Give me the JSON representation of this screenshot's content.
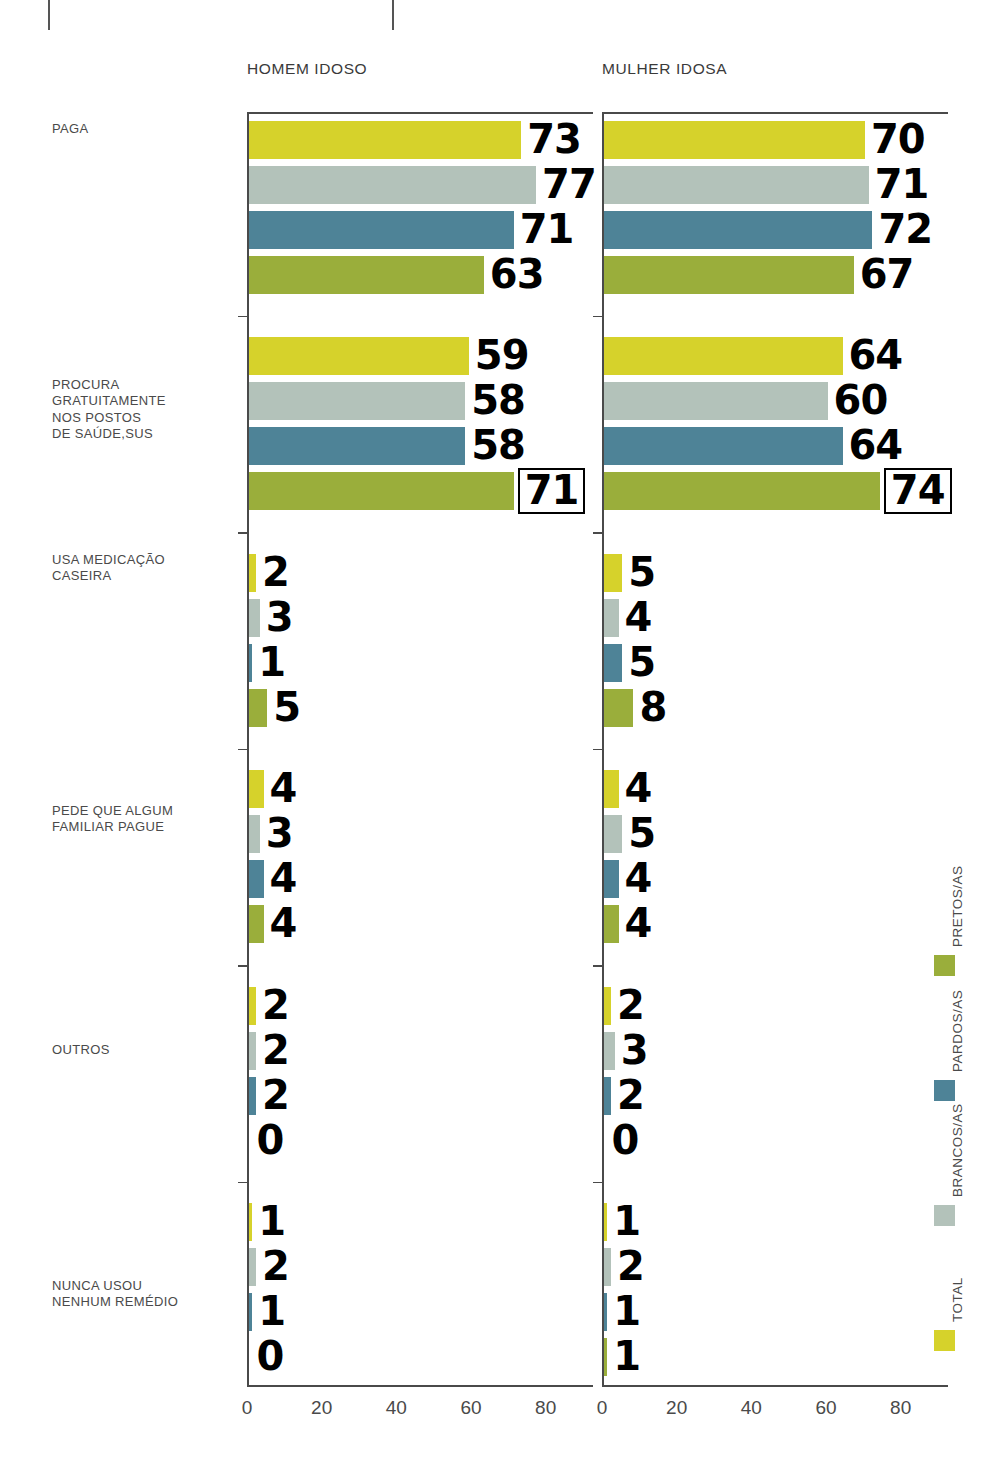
{
  "crop_marks": [
    48,
    392
  ],
  "panels": [
    {
      "id": "homem",
      "title": "HOMEM IDOSO"
    },
    {
      "id": "mulher",
      "title": "MULHER IDOSA"
    }
  ],
  "categories": [
    "PAGA",
    "PROCURA\nGRATUITAMENTE\nNOS POSTOS\nDE SAÚDE,SUS",
    "USA MEDICAÇÃO\nCASEIRA",
    "PEDE QUE ALGUM\nFAMILIAR PAGUE",
    "OUTROS",
    "NUNCA USOU\nNENHUM REMÉDIO"
  ],
  "series_names": [
    "TOTAL",
    "BRANCOS/AS",
    "PARDOS/AS",
    "PRETOS/AS"
  ],
  "colors": {
    "total": "#d6d22b",
    "brancos": "#b3c2ba",
    "pardos": "#4e8397",
    "pretos": "#9aae3b",
    "axis": "#4a4a4a",
    "text": "#4a4a4a",
    "value": "#000000"
  },
  "axis": {
    "ticks": [
      0,
      20,
      40,
      60,
      80
    ],
    "tick_labels": [
      "0",
      "20",
      "40",
      "60",
      "80"
    ],
    "min": 0,
    "max": 90
  },
  "legend": {
    "items": [
      {
        "label": "TOTAL",
        "color": "#d6d22b"
      },
      {
        "label": "BRANCOS/AS",
        "color": "#b3c2ba"
      },
      {
        "label": "PARDOS/AS",
        "color": "#4e8397"
      },
      {
        "label": "PRETOS/AS",
        "color": "#9aae3b"
      }
    ]
  },
  "chart_data": {
    "type": "bar",
    "title": "",
    "orientation": "horizontal",
    "xlabel": "",
    "ylabel": "",
    "xlim": [
      0,
      90
    ],
    "xticks": [
      0,
      20,
      40,
      60,
      80
    ],
    "grid": false,
    "legend_position": "right-vertical",
    "categories": [
      "PAGA",
      "PROCURA GRATUITAMENTE NOS POSTOS DE SAÚDE,SUS",
      "USA MEDICAÇÃO CASEIRA",
      "PEDE QUE ALGUM FAMILIAR PAGUE",
      "OUTROS",
      "NUNCA USOU NENHUM REMÉDIO"
    ],
    "panels": [
      {
        "name": "HOMEM IDOSO",
        "series": [
          {
            "name": "TOTAL",
            "values": [
              73,
              59,
              2,
              4,
              2,
              1
            ]
          },
          {
            "name": "BRANCOS/AS",
            "values": [
              77,
              58,
              3,
              3,
              2,
              2
            ]
          },
          {
            "name": "PARDOS/AS",
            "values": [
              71,
              58,
              1,
              4,
              2,
              1
            ]
          },
          {
            "name": "PRETOS/AS",
            "values": [
              63,
              71,
              5,
              4,
              0,
              0
            ]
          }
        ],
        "highlighted": [
          {
            "category": 1,
            "series": "PRETOS/AS",
            "value": 71
          }
        ]
      },
      {
        "name": "MULHER IDOSA",
        "series": [
          {
            "name": "TOTAL",
            "values": [
              70,
              64,
              5,
              4,
              2,
              1
            ]
          },
          {
            "name": "BRANCOS/AS",
            "values": [
              71,
              60,
              4,
              5,
              3,
              2
            ]
          },
          {
            "name": "PARDOS/AS",
            "values": [
              72,
              64,
              5,
              4,
              2,
              1
            ]
          },
          {
            "name": "PRETOS/AS",
            "values": [
              67,
              74,
              8,
              4,
              0,
              1
            ]
          }
        ],
        "highlighted": [
          {
            "category": 1,
            "series": "PRETOS/AS",
            "value": 74
          }
        ]
      }
    ]
  }
}
